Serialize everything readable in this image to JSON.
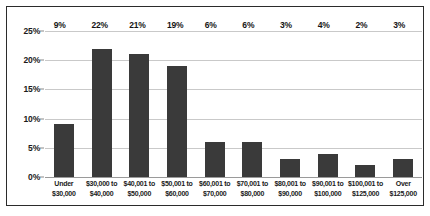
{
  "chart_data": {
    "type": "bar",
    "title": "",
    "subtitle": "",
    "xlabel": "",
    "ylabel": "",
    "ylim": [
      0,
      25
    ],
    "ytick_labels": [
      "0%",
      "5%",
      "10%",
      "15%",
      "20%",
      "25%"
    ],
    "ytick_values": [
      0,
      5,
      10,
      15,
      20,
      25
    ],
    "grid": true,
    "legend": false,
    "legend_position": "none",
    "bar_color": "#3a3a3a",
    "gridline_color": "#c9c9c9",
    "border_color": "#2b2b2b",
    "background_color": "#ffffff",
    "categories": [
      [
        "Under",
        "$30,000"
      ],
      [
        "$30,000 to",
        "$40,000"
      ],
      [
        "$40,001 to",
        "$50,000"
      ],
      [
        "$50,001 to",
        "$60,000"
      ],
      [
        "$60,001 to",
        "$70,000"
      ],
      [
        "$70,001 to",
        "$80,000"
      ],
      [
        "$80,001 to",
        "$90,000"
      ],
      [
        "$90,001 to",
        "$100,000"
      ],
      [
        "$100,001 to",
        "$125,000"
      ],
      [
        "Over",
        "$125,000"
      ]
    ],
    "values": [
      9,
      22,
      21,
      19,
      6,
      6,
      3,
      4,
      2,
      3
    ],
    "data_labels": [
      "9%",
      "22%",
      "21%",
      "19%",
      "6%",
      "6%",
      "3%",
      "4%",
      "2%",
      "3%"
    ]
  }
}
